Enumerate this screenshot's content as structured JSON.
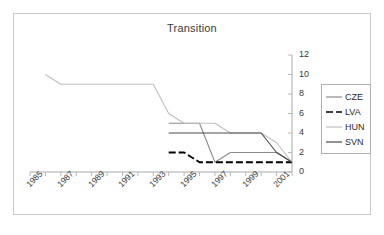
{
  "chart_data": {
    "type": "line",
    "title": "Transition",
    "xlabel": "",
    "ylabel": "",
    "xlim": [
      1985,
      2002
    ],
    "ylim": [
      0,
      12
    ],
    "yticks": [
      0,
      2,
      4,
      6,
      8,
      10,
      12
    ],
    "xticks": [
      1985,
      1987,
      1989,
      1991,
      1993,
      1995,
      1997,
      1999,
      2001
    ],
    "xticklabels": [
      "1985",
      "1987",
      "1989",
      "1991",
      "1993",
      "1995",
      "1997",
      "1999",
      "2001"
    ],
    "yticklabels": [
      "0",
      "2",
      "4",
      "6",
      "8",
      "10",
      "12"
    ],
    "grid": false,
    "legend_position": "right",
    "x": [
      1985,
      1986,
      1987,
      1988,
      1989,
      1990,
      1991,
      1992,
      1993,
      1994,
      1995,
      1996,
      1997,
      1998,
      1999,
      2000,
      2001,
      2002
    ],
    "series": [
      {
        "name": "CZE",
        "color": "#8c8c8c",
        "style": "solid",
        "values": [
          null,
          null,
          null,
          null,
          null,
          null,
          null,
          null,
          null,
          5,
          5,
          5,
          1,
          2,
          2,
          2,
          2,
          1
        ]
      },
      {
        "name": "LVA",
        "color": "#000000",
        "style": "dashed",
        "values": [
          null,
          null,
          null,
          null,
          null,
          null,
          null,
          null,
          null,
          2,
          2,
          1,
          1,
          1,
          1,
          1,
          1,
          1
        ]
      },
      {
        "name": "HUN",
        "color": "#bfbfbf",
        "style": "solid",
        "values": [
          null,
          10,
          9,
          9,
          9,
          9,
          9,
          9,
          9,
          6,
          5,
          5,
          5,
          4,
          4,
          4,
          3,
          1
        ]
      },
      {
        "name": "SVN",
        "color": "#4a4a4a",
        "style": "solid",
        "values": [
          null,
          null,
          null,
          null,
          null,
          null,
          null,
          null,
          null,
          4,
          4,
          4,
          4,
          4,
          4,
          4,
          2,
          1
        ]
      }
    ]
  },
  "legend": {
    "items": [
      {
        "label": "CZE"
      },
      {
        "label": "LVA"
      },
      {
        "label": "HUN"
      },
      {
        "label": "SVN"
      }
    ]
  },
  "axis": {
    "y_labels": [
      "12",
      "10",
      "8",
      "6",
      "4",
      "2",
      "0"
    ],
    "x_labels": [
      "1985",
      "1987",
      "1989",
      "1991",
      "1993",
      "1995",
      "1997",
      "1999",
      "2001"
    ]
  }
}
